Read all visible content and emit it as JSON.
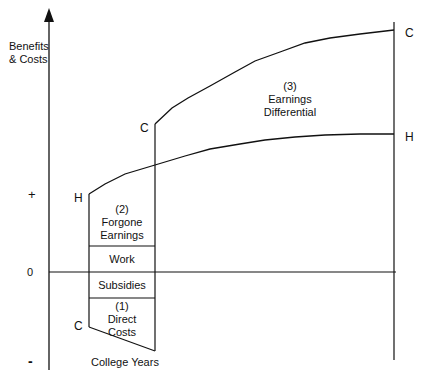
{
  "axis": {
    "y_label_line1": "Benefits",
    "y_label_line2": "& Costs",
    "plus": "+",
    "zero": "0",
    "minus": "-",
    "x_label": "College Years"
  },
  "curve_labels": {
    "c_left_bottom": "C",
    "h_left": "H",
    "c_mid": "C",
    "c_right": "C",
    "h_right": "H"
  },
  "regions": {
    "forgone": {
      "num": "(2)",
      "line1": "Forgone",
      "line2": "Earnings"
    },
    "work": {
      "label": "Work"
    },
    "subsidies": {
      "label": "Subsidies"
    },
    "direct": {
      "num": "(1)",
      "line1": "Direct",
      "line2": "Costs"
    },
    "differential": {
      "num": "(3)",
      "line1": "Earnings",
      "line2": "Differential"
    }
  },
  "colors": {
    "line": "#111111",
    "background": "#ffffff"
  }
}
